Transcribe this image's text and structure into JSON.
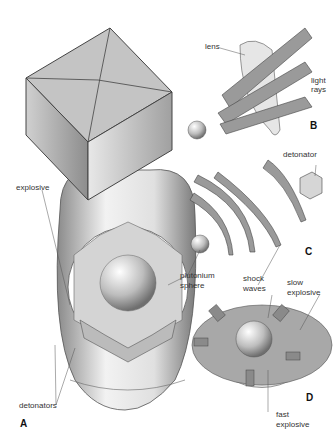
{
  "diagram": {
    "type": "technical-illustration",
    "panels": [
      {
        "id": "A",
        "label": "A",
        "labels": [
          "explosive",
          "detonators"
        ]
      },
      {
        "id": "B",
        "label": "B",
        "labels": [
          "lens",
          "light rays"
        ]
      },
      {
        "id": "C",
        "label": "C",
        "labels": [
          "detonator",
          "plutonium sphere",
          "shock waves"
        ]
      },
      {
        "id": "D",
        "label": "D",
        "labels": [
          "slow explosive",
          "fast explosive"
        ]
      }
    ]
  },
  "labels": {
    "explosive": "explosive",
    "detonators": "detonators",
    "lens": "lens",
    "light": "light",
    "rays": "rays",
    "detonator": "detonator",
    "plutonium": "plutonium",
    "sphere": "sphere",
    "shock": "shock",
    "waves": "waves",
    "slow": "slow",
    "slow_explosive": "explosive",
    "fast": "fast",
    "fast_explosive": "explosive"
  },
  "panel_letters": {
    "A": "A",
    "B": "B",
    "C": "C",
    "D": "D"
  },
  "colors": {
    "ink": "#333333",
    "panel_fill": "#9a9a9a",
    "light_fill": "#d8d8d8",
    "background": "#ffffff"
  }
}
